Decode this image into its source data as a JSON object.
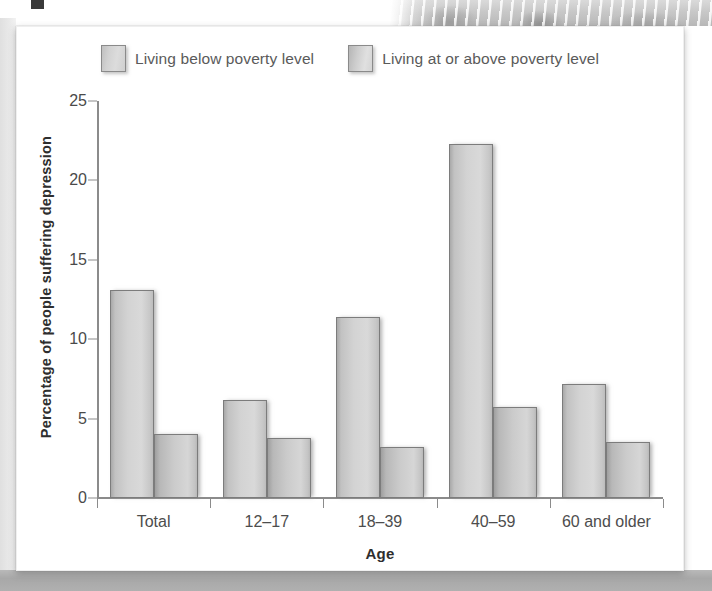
{
  "chart_data": {
    "type": "bar",
    "title": "",
    "xlabel": "Age",
    "ylabel": "Percentage of people suffering depression",
    "categories": [
      "Total",
      "12–17",
      "18–39",
      "40–59",
      "60 and older"
    ],
    "series": [
      {
        "name": "Living below poverty level",
        "values": [
          13.1,
          6.2,
          11.4,
          22.3,
          7.2
        ]
      },
      {
        "name": "Living at or above poverty level",
        "values": [
          4.0,
          3.8,
          3.2,
          5.7,
          3.5
        ]
      }
    ],
    "ylim": [
      0,
      25
    ],
    "yticks": [
      0,
      5,
      10,
      15,
      20,
      25
    ],
    "ytick_labels": [
      "0",
      "5",
      "10",
      "15",
      "20",
      "25"
    ],
    "grid": false,
    "legend_position": "top-center"
  },
  "legend": {
    "items": [
      {
        "label": "Living below poverty level",
        "swatch": "legend-swatch-below-poverty",
        "color": "#d3d3d3"
      },
      {
        "label": "Living at or above poverty level",
        "swatch": "legend-swatch-at-or-above-poverty",
        "color": "#cbcbcb"
      }
    ]
  },
  "axes": {
    "y_title": "Percentage of people suffering depression",
    "x_title": "Age",
    "axis_color": "#8b8b8b"
  },
  "colors": {
    "card_background": "#ffffff",
    "page_background": "#ffffff",
    "bar_below_poverty": "#d3d3d3",
    "bar_at_or_above_poverty": "#cbcbcb",
    "bar_border": "#7c7c7c",
    "text_primary": "#2e2e2e",
    "text_secondary": "#4d4d4d",
    "bottom_band": "#ada d ad"
  }
}
